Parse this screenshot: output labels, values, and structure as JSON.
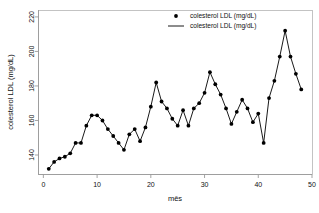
{
  "chart_data": {
    "type": "line",
    "title": "",
    "subtitle": "",
    "xlabel": "mês",
    "ylabel": "colesterol LDL (mg/dL)",
    "xlim": [
      -1,
      50
    ],
    "ylim": [
      129,
      224
    ],
    "xticks": [
      0,
      10,
      20,
      30,
      40,
      50
    ],
    "yticks": [
      140,
      160,
      180,
      200,
      220
    ],
    "grid": false,
    "legend_position": "top-center",
    "legend": [
      {
        "label": "colesterol LDL (mg/dL)",
        "marker": "point"
      },
      {
        "label": "colesterol LDL (mg/dL)",
        "marker": "line"
      }
    ],
    "series": [
      {
        "name": "colesterol LDL (mg/dL)",
        "color": "#000000",
        "marker": "circle",
        "x": [
          1,
          2,
          3,
          4,
          5,
          6,
          7,
          8,
          9,
          10,
          11,
          12,
          13,
          14,
          15,
          16,
          17,
          18,
          19,
          20,
          21,
          22,
          23,
          24,
          25,
          26,
          27,
          28,
          29,
          30,
          31,
          32,
          33,
          34,
          35,
          36,
          37,
          38,
          39,
          40,
          41,
          42,
          43,
          44,
          45,
          46,
          47,
          48
        ],
        "values": [
          132,
          136,
          138,
          139,
          141,
          147,
          147,
          157,
          163,
          163,
          160,
          155,
          151,
          147,
          143,
          152,
          155,
          148,
          156,
          168,
          182,
          171,
          167,
          161,
          157,
          166,
          157,
          167,
          170,
          176,
          188,
          181,
          175,
          167,
          158,
          165,
          172,
          167,
          159,
          164,
          147,
          173,
          183,
          197,
          212,
          197,
          187,
          178
        ]
      }
    ]
  },
  "axis": {
    "y_tick_labels": [
      "140",
      "160",
      "180",
      "200",
      "220"
    ],
    "x_tick_labels": [
      "0",
      "10",
      "20",
      "30",
      "40",
      "50"
    ],
    "y_title": "colesterol LDL (mg/dL)",
    "x_title": "mês"
  },
  "colors": {
    "line": "#000000",
    "marker": "#000000",
    "axis": "#9a9a9a",
    "frame": "#b5b5b5",
    "background": "#ffffff"
  }
}
